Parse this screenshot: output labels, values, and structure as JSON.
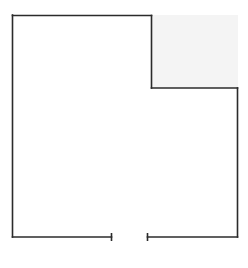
{
  "diagram": {
    "type": "floor-plan",
    "canvas": {
      "width": 248,
      "height": 268,
      "background": "#ffffff"
    },
    "wall_color": "#2b2b2b",
    "wall_width": 1.6,
    "cutout": {
      "x": 151,
      "y": 15,
      "width": 87,
      "height": 73,
      "fill": "#f4f4f4"
    },
    "walls": [
      {
        "id": "left-wall",
        "x1": 12.5,
        "y1": 15,
        "x2": 12.5,
        "y2": 237
      },
      {
        "id": "top-wall",
        "x1": 12.5,
        "y1": 15.5,
        "x2": 151.5,
        "y2": 15.5
      },
      {
        "id": "notch-vertical-wall",
        "x1": 151.5,
        "y1": 15.5,
        "x2": 151.5,
        "y2": 88
      },
      {
        "id": "notch-horizontal-wall",
        "x1": 151.5,
        "y1": 88,
        "x2": 237.5,
        "y2": 88
      },
      {
        "id": "right-wall",
        "x1": 237.5,
        "y1": 88,
        "x2": 237.5,
        "y2": 237
      },
      {
        "id": "bottom-wall-left",
        "x1": 12.5,
        "y1": 237,
        "x2": 111.5,
        "y2": 237
      },
      {
        "id": "bottom-wall-right",
        "x1": 147.5,
        "y1": 237,
        "x2": 237.5,
        "y2": 237
      }
    ],
    "door": {
      "label": "entrance-opening",
      "left_jamb": {
        "x": 111.5,
        "y1": 233,
        "y2": 241
      },
      "right_jamb": {
        "x": 147.5,
        "y1": 233,
        "y2": 241
      }
    }
  }
}
